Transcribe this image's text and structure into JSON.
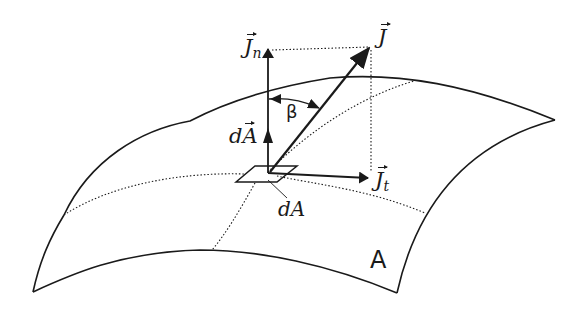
{
  "diagram": {
    "labels": {
      "J": "J",
      "Jn_main": "J",
      "Jn_sub": "n",
      "Jt_main": "J",
      "Jt_sub": "t",
      "dA_vec_d": "d",
      "dA_vec_A": "A",
      "beta": "β",
      "dA": "dA",
      "surface": "A"
    },
    "colors": {
      "stroke": "#1a1a1a",
      "background": "#ffffff"
    }
  }
}
